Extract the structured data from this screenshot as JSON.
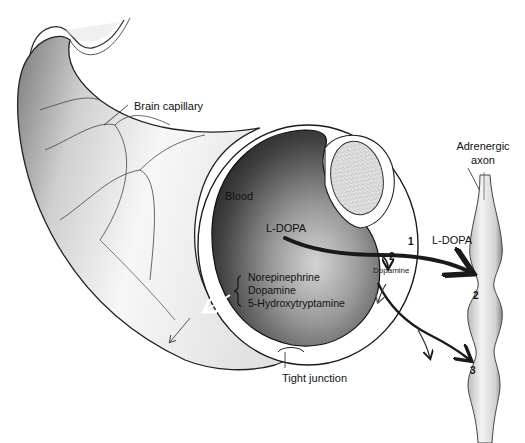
{
  "figure": {
    "labels": {
      "brain_capillary": "Brain capillary",
      "blood": "Blood",
      "l_dopa_inside": "L-DOPA",
      "l_dopa_outside": "L-DOPA",
      "dopamine_small": "Dopamine",
      "adrenergic_axon_line1": "Adrenergic",
      "adrenergic_axon_line2": "axon",
      "tight_junction": "Tight junction",
      "amines": [
        "Norepinephrine",
        "Dopamine",
        "5-Hydroxytryptamine"
      ]
    },
    "step_numbers": {
      "path_1": "1",
      "path_2_endothelium": "2",
      "path_2_axon": "2",
      "path_3": "3"
    },
    "colors": {
      "background": "#ffffff",
      "ink": "#111111",
      "blood_dark": "#2a2a2a",
      "blood_light": "#bdbdbd",
      "capillary_light": "#f0f0f0",
      "capillary_shade": "#a8a8a8",
      "nucleus": "#d8d8d8"
    }
  }
}
